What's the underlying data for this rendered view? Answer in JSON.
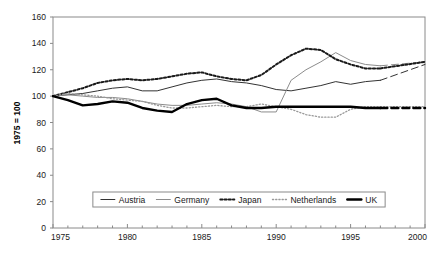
{
  "chart_data": {
    "type": "line",
    "title": "",
    "xlabel": "",
    "ylabel": "1975 = 100",
    "xlim": [
      1975,
      2000
    ],
    "ylim": [
      0,
      160
    ],
    "ytick_step": 20,
    "yticks": [
      0,
      20,
      40,
      60,
      80,
      100,
      120,
      140,
      160
    ],
    "xticks": [
      1975,
      1980,
      1985,
      1990,
      1995,
      2000
    ],
    "xtick_minor_step": 1,
    "grid": false,
    "legend_position": "inside-bottom-center",
    "x": [
      1975,
      1976,
      1977,
      1978,
      1979,
      1980,
      1981,
      1982,
      1983,
      1984,
      1985,
      1986,
      1987,
      1988,
      1989,
      1990,
      1991,
      1992,
      1993,
      1994,
      1995,
      1996,
      1997,
      2000
    ],
    "series": [
      {
        "name": "Austria",
        "style": "thin-solid-dark",
        "color": "#333333",
        "values": [
          100,
          101,
          102,
          104,
          106,
          107,
          104,
          104,
          107,
          110,
          112,
          113,
          111,
          110,
          108,
          105,
          104,
          106,
          108,
          111,
          109,
          111,
          112,
          124
        ]
      },
      {
        "name": "Germany",
        "style": "thin-solid-gray",
        "color": "#8c8c8c",
        "values": [
          100,
          101,
          100,
          99,
          99,
          98,
          96,
          94,
          93,
          93,
          94,
          95,
          94,
          92,
          88,
          88,
          112,
          120,
          126,
          133,
          127,
          124,
          123,
          126
        ]
      },
      {
        "name": "Japan",
        "style": "bold-dotted",
        "color": "#1a1a1a",
        "values": [
          100,
          103,
          106,
          110,
          112,
          113,
          112,
          113,
          115,
          117,
          118,
          115,
          113,
          112,
          116,
          124,
          131,
          136,
          135,
          128,
          124,
          121,
          121,
          126
        ]
      },
      {
        "name": "Netherlands",
        "style": "fine-dotted-gray",
        "color": "#999999",
        "values": [
          100,
          102,
          101,
          100,
          98,
          97,
          96,
          93,
          91,
          91,
          92,
          93,
          92,
          92,
          94,
          92,
          90,
          86,
          84,
          84,
          90,
          92,
          92,
          92
        ]
      },
      {
        "name": "UK",
        "style": "thick-solid-black",
        "color": "#000000",
        "values": [
          100,
          97,
          93,
          94,
          96,
          95,
          91,
          89,
          88,
          94,
          97,
          98,
          93,
          91,
          91,
          92,
          92,
          92,
          92,
          92,
          92,
          91,
          91,
          91
        ]
      }
    ],
    "projection": {
      "from_year": 1997,
      "to_year": 2000,
      "note": "final segment drawn dashed/sparse"
    }
  },
  "legend": {
    "items": [
      {
        "label": "Austria"
      },
      {
        "label": "Germany"
      },
      {
        "label": "Japan"
      },
      {
        "label": "Netherlands"
      },
      {
        "label": "UK"
      }
    ]
  },
  "axes": {
    "y_title": "1975 = 100",
    "y_ticks": [
      "0",
      "20",
      "40",
      "60",
      "80",
      "100",
      "120",
      "140",
      "160"
    ],
    "x_ticks": [
      "1975",
      "1980",
      "1985",
      "1990",
      "1995",
      "2000"
    ]
  }
}
